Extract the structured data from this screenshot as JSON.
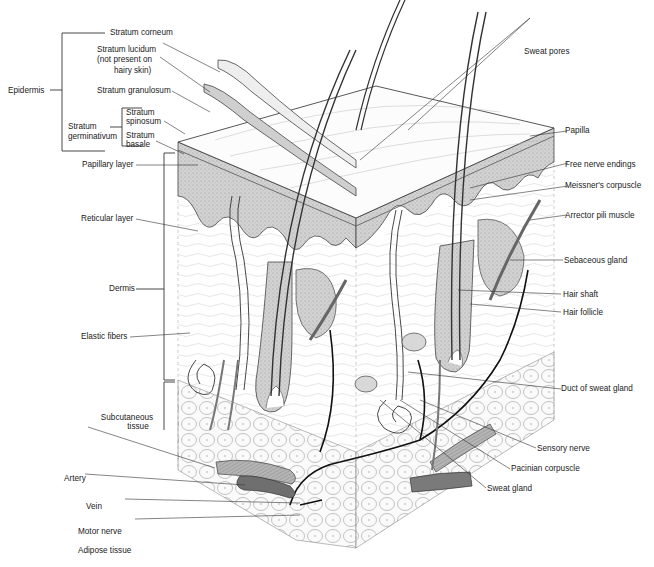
{
  "diagram": {
    "type": "anatomical-illustration"
  },
  "labels_left": {
    "epidermis": "Epidermis",
    "stratum_corneum": "Stratum corneum",
    "stratum_lucidum_1": "Stratum lucidum",
    "stratum_lucidum_2": "(not present on",
    "stratum_lucidum_3": "hairy skin)",
    "stratum_granulosum": "Stratum granulosum",
    "stratum_germinativum_1": "Stratum",
    "stratum_germinativum_2": "germinativum",
    "stratum_spinosum_1": "Stratum",
    "stratum_spinosum_2": "spinosum",
    "stratum_basale_1": "Stratum",
    "stratum_basale_2": "basale",
    "papillary_layer": "Papillary layer",
    "reticular_layer": "Reticular layer",
    "dermis": "Dermis",
    "elastic_fibers": "Elastic fibers",
    "subcutaneous_1": "Subcutaneous",
    "subcutaneous_2": "tissue",
    "artery": "Artery",
    "vein": "Vein",
    "motor_nerve": "Motor nerve",
    "adipose_tissue": "Adipose tissue"
  },
  "labels_right": {
    "sweat_pores": "Sweat pores",
    "papilla": "Papilla",
    "free_nerve_endings": "Free nerve endings",
    "meissners_corpuscle": "Meissner's corpuscle",
    "arrector_pili_muscle": "Arrector pili muscle",
    "sebaceous_gland": "Sebaceous gland",
    "hair_shaft": "Hair shaft",
    "hair_follicle": "Hair follicle",
    "duct_of_sweat_gland": "Duct of sweat gland",
    "sensory_nerve": "Sensory nerve",
    "pacinian_corpuscle": "Pacinian corpuscle",
    "sweat_gland": "Sweat gland"
  },
  "colors": {
    "ink": "#222222",
    "epidermis_fill": "#c9c9c9",
    "vessel_fill": "#8a8a8a",
    "vein_fill": "#6f6f6f",
    "background": "#ffffff"
  }
}
